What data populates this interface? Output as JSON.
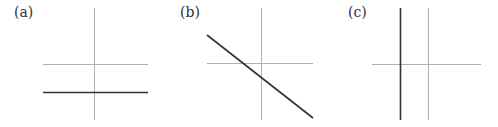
{
  "figure": {
    "panels": [
      {
        "id": "a",
        "label": "(a)",
        "description": "Horizontal line below the x-axis (constant function, negative y-intercept)"
      },
      {
        "id": "b",
        "label": "(b)",
        "description": "Line with negative slope crossing x-axis left of origin"
      },
      {
        "id": "c",
        "label": "(c)",
        "description": "Vertical line left of the y-axis"
      }
    ],
    "colors": {
      "axis": "#b0b0b0",
      "line": "#333333",
      "text": "#333333"
    }
  }
}
